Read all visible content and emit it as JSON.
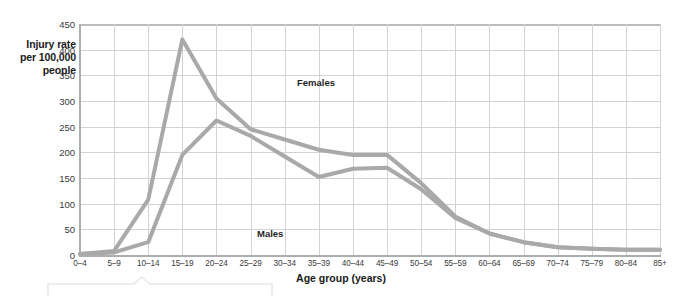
{
  "chart_data": {
    "type": "line",
    "title": "",
    "xlabel": "Age group (years)",
    "ylabel": "Injury rate per 100,000 people",
    "ylabel_lines": [
      "Injury rate",
      "per 100,000",
      "people"
    ],
    "categories": [
      "0–4",
      "5–9",
      "10–14",
      "15–19",
      "20–24",
      "25–29",
      "30–34",
      "35–39",
      "40–44",
      "45–49",
      "50–54",
      "55–59",
      "60–64",
      "65–69",
      "70–74",
      "75–79",
      "80–84",
      "85+"
    ],
    "ylim": [
      0,
      450
    ],
    "yticks": [
      0,
      50,
      100,
      150,
      200,
      250,
      300,
      350,
      400,
      450
    ],
    "ytick_labels": [
      "0",
      "50",
      "100",
      "150",
      "200",
      "250",
      "300",
      "350",
      "400",
      "450"
    ],
    "grid": true,
    "legend_position": "inline-annotation",
    "series": [
      {
        "name": "Females",
        "color": "#a9a9a9",
        "values": [
          2,
          8,
          108,
          420,
          305,
          245,
          225,
          205,
          195,
          195,
          140,
          75,
          42,
          25,
          15,
          12,
          10,
          10
        ]
      },
      {
        "name": "Males",
        "color": "#a9a9a9",
        "values": [
          2,
          5,
          25,
          195,
          262,
          232,
          192,
          152,
          168,
          170,
          128,
          72,
          42,
          25,
          15,
          12,
          10,
          10
        ]
      }
    ],
    "annotations": [
      {
        "text": "Females",
        "category": "20–24",
        "value": 390
      },
      {
        "text": "Males",
        "category": "15–19",
        "value": 62
      }
    ]
  }
}
